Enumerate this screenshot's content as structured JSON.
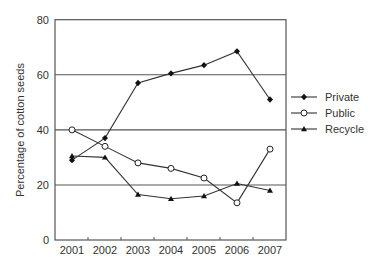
{
  "chart_data": {
    "type": "line",
    "title": "",
    "xlabel": "",
    "ylabel": "Percentage of cotton seeds",
    "ylim": [
      0,
      80
    ],
    "yticks": [
      0,
      20,
      40,
      60,
      80
    ],
    "grid": "horizontal",
    "legend_position": "right",
    "categories": [
      "2001",
      "2002",
      "2003",
      "2004",
      "2005",
      "2006",
      "2007"
    ],
    "series": [
      {
        "name": "Private",
        "marker": "diamond-filled",
        "values": [
          29,
          37,
          57,
          60.5,
          63.5,
          68.5,
          51
        ]
      },
      {
        "name": "Public",
        "marker": "circle-open",
        "values": [
          40,
          34,
          28,
          26,
          22.5,
          13.5,
          33
        ]
      },
      {
        "name": "Recycle",
        "marker": "triangle-filled",
        "values": [
          30.5,
          30,
          16.5,
          15,
          16,
          20.5,
          18
        ]
      }
    ]
  },
  "colors": {
    "line": "#333333",
    "grid": "#555555",
    "text": "#333333"
  }
}
